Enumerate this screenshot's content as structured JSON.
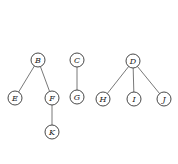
{
  "diagram": {
    "type": "forest",
    "node_radius": 7,
    "colors": {
      "node_stroke": "#333333",
      "edge": "#555555",
      "label": "#222222",
      "background": "#ffffff"
    },
    "nodes": [
      {
        "id": "B",
        "label": "B",
        "x": 38,
        "y": 60
      },
      {
        "id": "E",
        "label": "E",
        "x": 15,
        "y": 98
      },
      {
        "id": "F",
        "label": "F",
        "x": 52,
        "y": 98
      },
      {
        "id": "K",
        "label": "K",
        "x": 52,
        "y": 132
      },
      {
        "id": "C",
        "label": "C",
        "x": 77,
        "y": 60
      },
      {
        "id": "G",
        "label": "G",
        "x": 77,
        "y": 97
      },
      {
        "id": "D",
        "label": "D",
        "x": 133,
        "y": 61
      },
      {
        "id": "H",
        "label": "H",
        "x": 103,
        "y": 99
      },
      {
        "id": "I",
        "label": "I",
        "x": 134,
        "y": 99
      },
      {
        "id": "J",
        "label": "J",
        "x": 164,
        "y": 99
      }
    ],
    "edges": [
      {
        "from": "B",
        "to": "E"
      },
      {
        "from": "B",
        "to": "F"
      },
      {
        "from": "F",
        "to": "K"
      },
      {
        "from": "C",
        "to": "G"
      },
      {
        "from": "D",
        "to": "H"
      },
      {
        "from": "D",
        "to": "I"
      },
      {
        "from": "D",
        "to": "J"
      }
    ]
  }
}
